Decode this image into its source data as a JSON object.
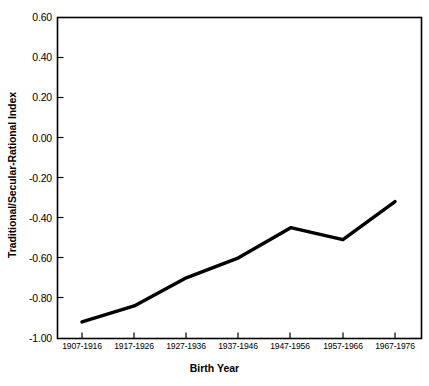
{
  "chart_data": {
    "type": "line",
    "title": "",
    "xlabel": "Birth Year",
    "ylabel": "Traditional/Secular-Rational Index",
    "categories": [
      "1907-1916",
      "1917-1926",
      "1927-1936",
      "1937-1946",
      "1947-1956",
      "1957-1966",
      "1967-1976"
    ],
    "values": [
      -0.92,
      -0.84,
      -0.7,
      -0.6,
      -0.45,
      -0.51,
      -0.32
    ],
    "series": [
      {
        "name": "Traditional/Secular-Rational Index",
        "values": [
          -0.92,
          -0.84,
          -0.7,
          -0.6,
          -0.45,
          -0.51,
          -0.32
        ]
      }
    ],
    "ylim": [
      -1.0,
      0.6
    ],
    "yticks": [
      0.6,
      0.4,
      0.2,
      0.0,
      -0.2,
      -0.4,
      -0.6,
      -0.8,
      -1.0
    ],
    "ytick_labels": [
      "0.60",
      "0.40",
      "0.20",
      "0.00",
      "-0.20",
      "-0.40",
      "-0.60",
      "-0.80",
      "-1.00"
    ],
    "grid": false,
    "legend": false,
    "legend_position": "none",
    "line_color": "#000000",
    "axis_color": "#000000",
    "background_color": "#ffffff"
  },
  "axes": {
    "y_axis_title": "Traditional/Secular-Rational Index",
    "x_axis_title": "Birth Year"
  }
}
